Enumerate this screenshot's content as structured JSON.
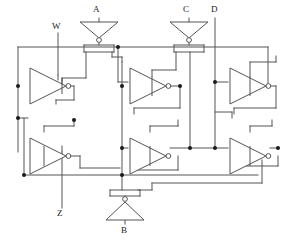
{
  "diagram": {
    "width": 287,
    "height": 243,
    "colors": {
      "wire": "#555555",
      "gate_outline": "#555555",
      "node_dot": "#1a1a1a",
      "bubble_fill": "#ffffff",
      "label_text": "#1a1a1a",
      "background": "#ffffff"
    },
    "stroke_width": 1
  },
  "labels": {
    "input_a": "A",
    "input_b": "B",
    "input_c": "C",
    "input_d": "D",
    "input_w": "W",
    "output_z": "Z"
  },
  "ports": [
    {
      "name": "A",
      "label": "A",
      "kind": "input",
      "x": 96,
      "y": 14
    },
    {
      "name": "C",
      "label": "C",
      "kind": "input",
      "x": 186,
      "y": 14
    },
    {
      "name": "D",
      "label": "D",
      "kind": "input",
      "x": 215,
      "y": 14
    },
    {
      "name": "W",
      "label": "W",
      "kind": "input",
      "x": 55,
      "y": 30
    },
    {
      "name": "B",
      "label": "B",
      "kind": "input",
      "x": 125,
      "y": 232
    },
    {
      "name": "Z",
      "label": "Z",
      "kind": "output",
      "x": 60,
      "y": 215
    }
  ],
  "input_inverters": [
    {
      "name": "inverter-a",
      "label": "A",
      "direction": "down",
      "cx": 99,
      "cy": 32
    },
    {
      "name": "inverter-c",
      "label": "C",
      "direction": "down",
      "cx": 189,
      "cy": 32
    },
    {
      "name": "inverter-b",
      "label": "B",
      "direction": "up",
      "cx": 125,
      "cy": 212
    }
  ],
  "tristate_inverters": [
    {
      "name": "tristate-inverter-top-left",
      "row": "top",
      "column": "left",
      "x": 28,
      "y": 62
    },
    {
      "name": "tristate-inverter-top-middle",
      "row": "top",
      "column": "middle",
      "x": 128,
      "y": 62
    },
    {
      "name": "tristate-inverter-top-right",
      "row": "top",
      "column": "right",
      "x": 228,
      "y": 62
    },
    {
      "name": "tristate-inverter-bottom-left",
      "row": "bottom",
      "column": "left",
      "x": 28,
      "y": 132
    },
    {
      "name": "tristate-inverter-bottom-middle",
      "row": "bottom",
      "column": "middle",
      "x": 128,
      "y": 132
    },
    {
      "name": "tristate-inverter-bottom-right",
      "row": "bottom",
      "column": "right",
      "x": 228,
      "y": 132
    }
  ],
  "counts": {
    "tristate_inverters": 6,
    "input_inverters": 3,
    "inputs": 5,
    "outputs": 1
  }
}
